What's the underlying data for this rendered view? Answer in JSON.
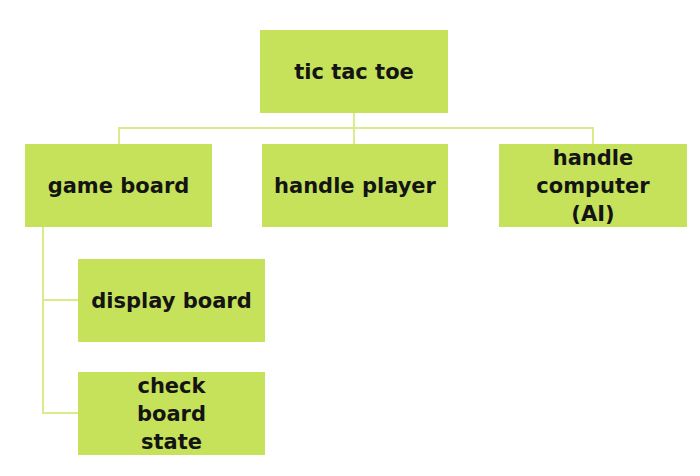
{
  "diagram": {
    "type": "hierarchy",
    "colors": {
      "box": "#c5e25a",
      "connector": "#d8ec8a",
      "text": "#141414",
      "background": "#ffffff"
    },
    "root": {
      "label": "tic tac toe"
    },
    "children": [
      {
        "label": "game board",
        "children": [
          {
            "label": "display board"
          },
          {
            "label": "check board state"
          }
        ]
      },
      {
        "label": "handle player"
      },
      {
        "label": "handle computer (AI)"
      }
    ]
  }
}
